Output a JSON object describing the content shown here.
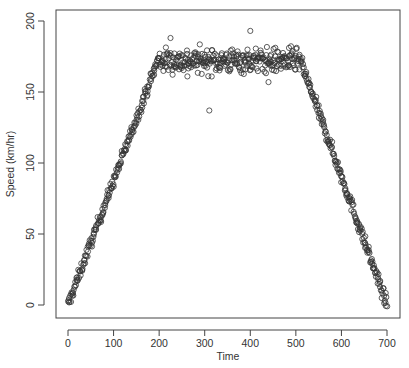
{
  "chart_data": {
    "type": "scatter",
    "title": "",
    "xlabel": "Time",
    "ylabel": "Speed (km/hr)",
    "xlim": [
      -10,
      730
    ],
    "ylim": [
      -10,
      210
    ],
    "x_ticks": [
      0,
      100,
      200,
      300,
      400,
      500,
      600,
      700
    ],
    "y_ticks": [
      0,
      50,
      100,
      150,
      200
    ],
    "grid": false,
    "legend": null,
    "marker": "open-circle",
    "marker_color": "#333333",
    "segments": [
      {
        "name": "acceleration",
        "t_start": 0,
        "t_end": 200,
        "v_start": 0,
        "v_end": 175
      },
      {
        "name": "cruise",
        "t_start": 200,
        "t_end": 510,
        "v_mean": 172,
        "noise": 8
      },
      {
        "name": "deceleration",
        "t_start": 510,
        "t_end": 700,
        "v_start": 172,
        "v_end": 0
      }
    ],
    "outliers": [
      {
        "x": 225,
        "y": 188
      },
      {
        "x": 310,
        "y": 137
      },
      {
        "x": 400,
        "y": 193
      },
      {
        "x": 440,
        "y": 157
      },
      {
        "x": 262,
        "y": 161
      }
    ],
    "sample_points": [
      {
        "x": 0,
        "y": 2
      },
      {
        "x": 10,
        "y": 8
      },
      {
        "x": 20,
        "y": 18
      },
      {
        "x": 40,
        "y": 35
      },
      {
        "x": 60,
        "y": 55
      },
      {
        "x": 80,
        "y": 70
      },
      {
        "x": 100,
        "y": 88
      },
      {
        "x": 120,
        "y": 105
      },
      {
        "x": 140,
        "y": 122
      },
      {
        "x": 160,
        "y": 140
      },
      {
        "x": 180,
        "y": 158
      },
      {
        "x": 200,
        "y": 172
      },
      {
        "x": 250,
        "y": 174
      },
      {
        "x": 300,
        "y": 172
      },
      {
        "x": 350,
        "y": 171
      },
      {
        "x": 400,
        "y": 173
      },
      {
        "x": 450,
        "y": 172
      },
      {
        "x": 500,
        "y": 174
      },
      {
        "x": 520,
        "y": 165
      },
      {
        "x": 550,
        "y": 140
      },
      {
        "x": 580,
        "y": 115
      },
      {
        "x": 600,
        "y": 98
      },
      {
        "x": 620,
        "y": 80
      },
      {
        "x": 650,
        "y": 50
      },
      {
        "x": 670,
        "y": 30
      },
      {
        "x": 690,
        "y": 10
      },
      {
        "x": 700,
        "y": 3
      }
    ],
    "n_points": 700
  }
}
